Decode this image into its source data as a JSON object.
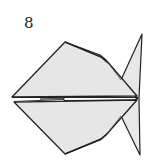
{
  "diagram": {
    "step_number": "8",
    "colors": {
      "paper_fill": "#e6e6e6",
      "outline": "#222222",
      "background": "#ffffff"
    }
  }
}
